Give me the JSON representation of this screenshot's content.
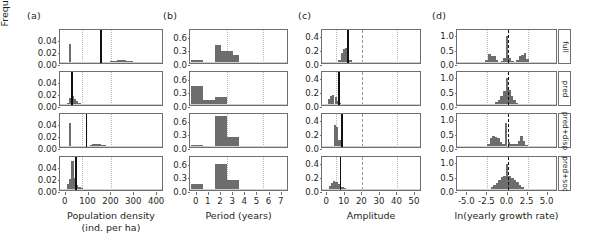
{
  "figure": {
    "width": 597,
    "height": 248,
    "shared_ylabel": "Frequency",
    "row_labels": [
      "full",
      "pred",
      "pred+disp",
      "pred+soc"
    ],
    "bar_color": "#6d6d6d",
    "line_color": "#111111",
    "grid_color": "#b9b9b9"
  },
  "panels": [
    {
      "letter": "(a)",
      "xlabel": "Population density",
      "xlabel2": "(ind. per ha)",
      "xticks": [
        "0",
        "100",
        "200",
        "300",
        "400"
      ],
      "xtickvals": [
        0,
        100,
        200,
        300,
        400
      ],
      "xlim": [
        -25,
        430
      ],
      "yticks": [
        "0.00",
        "0.02",
        "0.04"
      ],
      "ytickvals": [
        0.0,
        0.02,
        0.04
      ],
      "ylim": [
        0,
        0.056
      ],
      "gridlines": [
        70,
        200
      ],
      "graygrid": [],
      "chart_data": {
        "type": "bar",
        "title": "Population density",
        "xlabel": "Population density (ind. per ha)",
        "ylabel": "Frequency",
        "rows": [
          {
            "name": "full",
            "vline": 150,
            "binwidth": 10,
            "x": [
              20,
              30,
              40,
              50,
              60,
              70,
              80,
              90,
              100,
              110,
              120,
              130,
              140,
              150,
              160,
              170,
              180,
              190,
              200,
              210,
              220,
              230,
              240,
              250,
              260,
              270,
              280,
              290,
              300,
              310,
              320,
              330,
              340
            ],
            "y": [
              0.033,
              0.002,
              0.0,
              0.0,
              0.0,
              0.0,
              0.0,
              0.0,
              0.0,
              0.0,
              0.0,
              0.0,
              0.0,
              0.0,
              0.001,
              0.0015,
              0.002,
              0.0025,
              0.003,
              0.0035,
              0.004,
              0.0045,
              0.005,
              0.005,
              0.0045,
              0.004,
              0.0035,
              0.003,
              0.002,
              0.0015,
              0.001,
              0.0005,
              0.0002
            ]
          },
          {
            "name": "pred",
            "vline": 24,
            "binwidth": 10,
            "x": [
              10,
              20,
              30,
              40,
              50,
              60,
              70,
              80,
              90
            ],
            "y": [
              0.004,
              0.012,
              0.016,
              0.01,
              0.006,
              0.003,
              0.001,
              0.0005,
              0.0002
            ]
          },
          {
            "name": "pred+disp",
            "vline": 88,
            "binwidth": 10,
            "x": [
              20,
              30,
              40,
              50,
              60,
              70,
              80,
              90,
              100,
              110,
              120,
              130,
              140,
              150,
              160,
              170,
              180,
              190,
              200
            ],
            "y": [
              0.04,
              0.002,
              0.0,
              0.0,
              0.0,
              0.0,
              0.0,
              0.001,
              0.002,
              0.003,
              0.0045,
              0.005,
              0.005,
              0.0045,
              0.004,
              0.003,
              0.002,
              0.001,
              0.0005
            ]
          },
          {
            "name": "pred+soc",
            "vline": 42,
            "binwidth": 10,
            "x": [
              10,
              20,
              30,
              40,
              50,
              60,
              70,
              80,
              90,
              100,
              110
            ],
            "y": [
              0.01,
              0.018,
              0.05,
              0.02,
              0.009,
              0.005,
              0.003,
              0.002,
              0.0015,
              0.001,
              0.0005
            ]
          }
        ]
      }
    },
    {
      "letter": "(b)",
      "xlabel": "Period (years)",
      "xlabel2": "",
      "xticks": [
        "0",
        "1",
        "2",
        "3",
        "4",
        "5",
        "6",
        "7"
      ],
      "xtickvals": [
        0,
        1,
        2,
        3,
        4,
        5,
        6,
        7
      ],
      "xlim": [
        -0.55,
        7.6
      ],
      "yticks": [
        "0.0",
        "0.3",
        "0.6"
      ],
      "ytickvals": [
        0.0,
        0.3,
        0.6
      ],
      "ylim": [
        0,
        0.72
      ],
      "gridlines": [
        2.5,
        5.5
      ],
      "graygrid": [],
      "chart_data": {
        "type": "bar",
        "title": "Period (years)",
        "xlabel": "Period (years)",
        "ylabel": "Frequency",
        "rows": [
          {
            "name": "full",
            "vline": null,
            "binwidth": 0.5,
            "x": [
              -0.25,
              0.25,
              1.75,
              2.25,
              2.75,
              3.25,
              6.75
            ],
            "y": [
              0.06,
              0.06,
              0.4,
              0.26,
              0.26,
              0.18,
              0.03
            ]
          },
          {
            "name": "pred",
            "vline": null,
            "binwidth": 0.5,
            "x": [
              -0.25,
              0.25,
              0.75,
              1.25,
              1.75,
              2.25,
              2.75,
              3.75,
              4.25,
              4.75,
              5.25,
              6.25,
              6.75,
              7.25
            ],
            "y": [
              0.42,
              0.42,
              0.11,
              0.11,
              0.17,
              0.17,
              0.02,
              0.03,
              0.03,
              0.03,
              0.03,
              0.02,
              0.02,
              0.02
            ]
          },
          {
            "name": "pred+disp",
            "vline": null,
            "binwidth": 0.5,
            "x": [
              -0.25,
              0.25,
              1.75,
              2.25,
              2.75,
              3.25,
              4.75,
              5.25
            ],
            "y": [
              0.04,
              0.04,
              0.67,
              0.67,
              0.21,
              0.21,
              0.02,
              0.02
            ]
          },
          {
            "name": "pred+soc",
            "vline": null,
            "binwidth": 0.5,
            "x": [
              -0.25,
              0.25,
              1.75,
              2.25,
              2.75,
              3.25,
              4.75,
              5.25,
              5.75
            ],
            "y": [
              0.13,
              0.13,
              0.56,
              0.56,
              0.21,
              0.21,
              0.03,
              0.03,
              0.01
            ]
          }
        ]
      }
    },
    {
      "letter": "(c)",
      "xlabel": "Amplitude",
      "xlabel2": "",
      "xticks": [
        "0",
        "10",
        "20",
        "30",
        "40",
        "50"
      ],
      "xtickvals": [
        0,
        10,
        20,
        30,
        40,
        50
      ],
      "xlim": [
        -3,
        54
      ],
      "yticks": [
        "0.0",
        "0.2",
        "0.4"
      ],
      "ytickvals": [
        0.0,
        0.2,
        0.4
      ],
      "ylim": [
        0,
        0.47
      ],
      "gridlines": [
        5,
        40
      ],
      "graygrid": [
        20
      ],
      "chart_data": {
        "type": "bar",
        "title": "Amplitude",
        "xlabel": "Amplitude",
        "ylabel": "Frequency",
        "rows": [
          {
            "name": "full",
            "vline": 11.5,
            "binwidth": 1.25,
            "x": [
              7,
              8.25,
              9.5,
              10.75,
              12,
              13.25,
              14.5,
              15.75,
              17
            ],
            "y": [
              0.05,
              0.14,
              0.2,
              0.22,
              0.18,
              0.05,
              0.02,
              0.01,
              0.005
            ]
          },
          {
            "name": "pred",
            "vline": 6.2,
            "binwidth": 1.25,
            "x": [
              1,
              2.25,
              3.5,
              4.75,
              6,
              7.25,
              8.5,
              9.75,
              11,
              13,
              15,
              17,
              19,
              21,
              23,
              26,
              29
            ],
            "y": [
              0.09,
              0.13,
              0.14,
              0.11,
              0.06,
              0.03,
              0.02,
              0.015,
              0.012,
              0.01,
              0.008,
              0.006,
              0.005,
              0.004,
              0.003,
              0.002,
              0.002
            ]
          },
          {
            "name": "pred+disp",
            "vline": 8.0,
            "binwidth": 1.25,
            "x": [
              4.5,
              5.75,
              7,
              8.25,
              9.5,
              10.75,
              12,
              13.5,
              15,
              17,
              19,
              21
            ],
            "y": [
              0.31,
              0.28,
              0.1,
              0.04,
              0.02,
              0.015,
              0.012,
              0.008,
              0.006,
              0.004,
              0.003,
              0.002
            ]
          },
          {
            "name": "pred+soc",
            "vline": 7.2,
            "binwidth": 1.25,
            "x": [
              1.5,
              2.75,
              4,
              5.25,
              6.5,
              7.75,
              9,
              10.25,
              11.5,
              13,
              15,
              17,
              19,
              22
            ],
            "y": [
              0.06,
              0.1,
              0.13,
              0.12,
              0.09,
              0.05,
              0.04,
              0.03,
              0.02,
              0.012,
              0.008,
              0.006,
              0.004,
              0.002
            ]
          }
        ]
      }
    },
    {
      "letter": "(d)",
      "xlabel": "ln(yearly growth rate)",
      "xlabel2": "",
      "xticks": [
        "-5.0",
        "-2.5",
        "0.0",
        "2.5",
        "5.0"
      ],
      "xtickvals": [
        -5.0,
        -2.5,
        0.0,
        2.5,
        5.0
      ],
      "xlim": [
        -6.3,
        6.3
      ],
      "yticks": [
        "0.0",
        "0.5",
        "1.0"
      ],
      "ytickvals": [
        0.0,
        0.5,
        1.0
      ],
      "ylim": [
        0,
        1.15
      ],
      "gridlines": [
        -2.5,
        2.5
      ],
      "graygrid": [],
      "chart_data": {
        "type": "bar",
        "title": "ln(yearly growth rate)",
        "xlabel": "ln(yearly growth rate)",
        "ylabel": "Frequency",
        "dashed_vline": 0,
        "rows": [
          {
            "name": "full",
            "vline": 0,
            "binwidth": 0.32,
            "x": [
              -2.6,
              -2.28,
              -1.96,
              -1.64,
              -1.32,
              -1.0,
              -0.68,
              -0.36,
              -0.04,
              0.28,
              0.6,
              0.92,
              1.24,
              1.56,
              1.88,
              2.2,
              2.52
            ],
            "y": [
              0.12,
              0.3,
              0.24,
              0.26,
              0.12,
              0.05,
              0.06,
              0.18,
              0.95,
              0.17,
              0.06,
              0.05,
              0.1,
              0.24,
              0.28,
              0.34,
              0.13
            ]
          },
          {
            "name": "pred",
            "vline": 0,
            "binwidth": 0.32,
            "x": [
              -2.0,
              -1.68,
              -1.36,
              -1.04,
              -0.72,
              -0.4,
              -0.08,
              0.24,
              0.56,
              0.88,
              1.2,
              1.52,
              1.84
            ],
            "y": [
              0.03,
              0.05,
              0.1,
              0.18,
              0.3,
              0.48,
              0.95,
              0.52,
              0.3,
              0.16,
              0.08,
              0.04,
              0.02
            ]
          },
          {
            "name": "pred+disp",
            "vline": 0,
            "binwidth": 0.32,
            "x": [
              -2.4,
              -2.08,
              -1.76,
              -1.44,
              -1.12,
              -0.8,
              -0.48,
              -0.16,
              0.16,
              0.48,
              0.8,
              1.12,
              1.44,
              1.76,
              2.08,
              2.4
            ],
            "y": [
              0.09,
              0.3,
              0.38,
              0.36,
              0.32,
              0.16,
              0.12,
              0.85,
              0.16,
              0.12,
              0.1,
              0.12,
              0.2,
              0.4,
              0.22,
              0.08
            ]
          },
          {
            "name": "pred+soc",
            "vline": 0,
            "binwidth": 0.32,
            "x": [
              -2.6,
              -2.28,
              -1.96,
              -1.64,
              -1.32,
              -1.0,
              -0.68,
              -0.36,
              -0.04,
              0.28,
              0.6,
              0.92,
              1.24,
              1.56,
              1.88,
              2.2
            ],
            "y": [
              0.02,
              0.05,
              0.1,
              0.18,
              0.26,
              0.36,
              0.44,
              0.5,
              0.9,
              0.48,
              0.42,
              0.36,
              0.28,
              0.18,
              0.1,
              0.04
            ]
          }
        ]
      }
    }
  ]
}
